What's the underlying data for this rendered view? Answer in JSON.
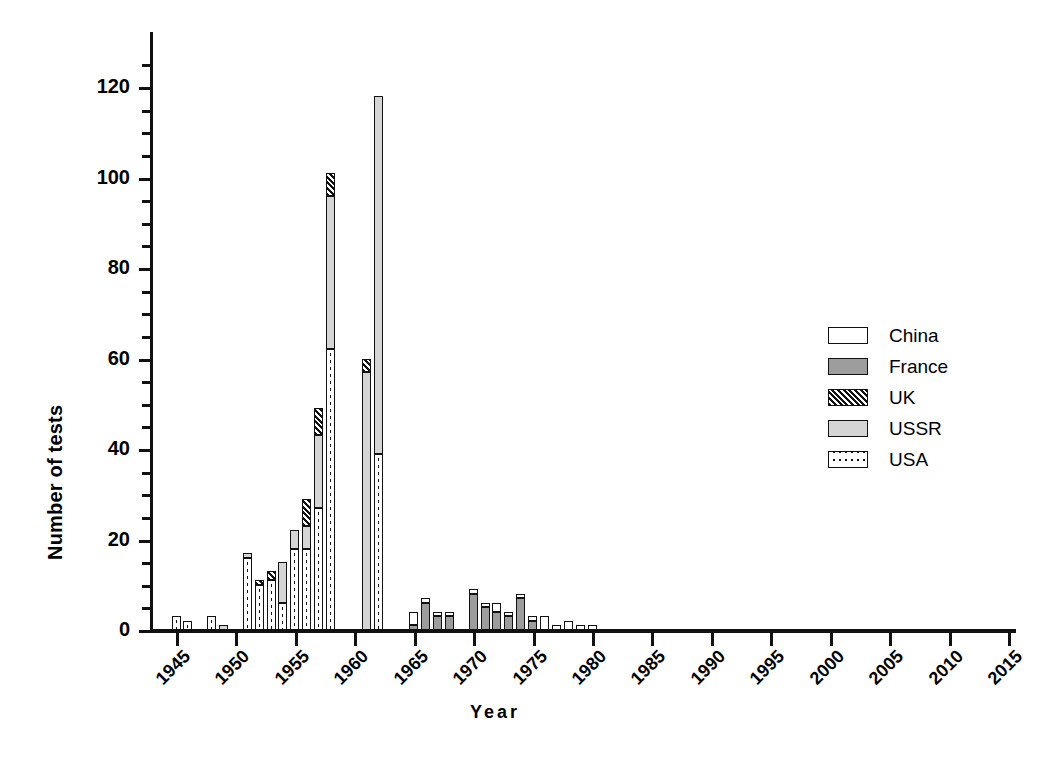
{
  "chart_data": {
    "type": "bar",
    "stacked": true,
    "title": "",
    "xlabel": "Year",
    "ylabel": "Number of tests",
    "xlim": [
      1943,
      2016
    ],
    "ylim": [
      0,
      128
    ],
    "ytick_major": [
      0,
      20,
      40,
      60,
      80,
      100,
      120
    ],
    "ytick_minor_step": 5,
    "xticks": [
      1945,
      1950,
      1955,
      1960,
      1965,
      1970,
      1975,
      1980,
      1985,
      1990,
      1995,
      2000,
      2005,
      2010,
      2015
    ],
    "grid": false,
    "legend_position": "right",
    "series_order": [
      "USA",
      "USSR",
      "UK",
      "France",
      "China"
    ],
    "legend": [
      {
        "name": "China",
        "pattern": "solid-white",
        "color": "#ffffff"
      },
      {
        "name": "France",
        "pattern": "solid-gray",
        "color": "#9d9d9d"
      },
      {
        "name": "UK",
        "pattern": "diagonal-hatch",
        "color": "#111111"
      },
      {
        "name": "USSR",
        "pattern": "light-gray",
        "color": "#d5d5d5"
      },
      {
        "name": "USA",
        "pattern": "dotted",
        "color": "#ffffff"
      }
    ],
    "categories": [
      1945,
      1946,
      1947,
      1948,
      1949,
      1950,
      1951,
      1952,
      1953,
      1954,
      1955,
      1956,
      1957,
      1958,
      1959,
      1960,
      1961,
      1962,
      1963,
      1964,
      1965,
      1966,
      1967,
      1968,
      1969,
      1970,
      1971,
      1972,
      1973,
      1974,
      1975,
      1976,
      1977,
      1978,
      1979,
      1980,
      1981,
      1982,
      1983,
      1984,
      1985,
      1986,
      1987,
      1988,
      1989,
      1990,
      1991,
      1992,
      1993,
      1994,
      1995,
      1996,
      1997,
      1998,
      1999,
      2000,
      2001,
      2002,
      2003,
      2004,
      2005,
      2006,
      2007,
      2008,
      2009,
      2010,
      2011,
      2012,
      2013,
      2014,
      2015
    ],
    "series": [
      {
        "name": "USA",
        "values": [
          3,
          2,
          0,
          3,
          0,
          0,
          16,
          10,
          11,
          6,
          18,
          18,
          27,
          62,
          0,
          0,
          0,
          39,
          0,
          0,
          0,
          0,
          0,
          0,
          0,
          0,
          0,
          0,
          0,
          0,
          0,
          0,
          0,
          0,
          0,
          0,
          0,
          0,
          0,
          0,
          0,
          0,
          0,
          0,
          0,
          0,
          0,
          0,
          0,
          0,
          0,
          0,
          0,
          0,
          0,
          0,
          0,
          0,
          0,
          0,
          0,
          0,
          0,
          0,
          0,
          0,
          0,
          0,
          0,
          0,
          0
        ]
      },
      {
        "name": "USSR",
        "values": [
          0,
          0,
          0,
          0,
          1,
          0,
          1,
          0,
          0,
          9,
          4,
          5,
          16,
          34,
          0,
          0,
          57,
          79,
          0,
          0,
          0,
          0,
          0,
          0,
          0,
          0,
          0,
          0,
          0,
          0,
          0,
          0,
          0,
          0,
          0,
          0,
          0,
          0,
          0,
          0,
          0,
          0,
          0,
          0,
          0,
          0,
          0,
          0,
          0,
          0,
          0,
          0,
          0,
          0,
          0,
          0,
          0,
          0,
          0,
          0,
          0,
          0,
          0,
          0,
          0,
          0,
          0,
          0,
          0,
          0,
          0
        ]
      },
      {
        "name": "UK",
        "values": [
          0,
          0,
          0,
          0,
          0,
          0,
          0,
          1,
          2,
          0,
          0,
          6,
          6,
          5,
          0,
          0,
          3,
          0,
          0,
          0,
          0,
          0,
          0,
          0,
          0,
          0,
          0,
          0,
          0,
          0,
          0,
          0,
          0,
          0,
          0,
          0,
          0,
          0,
          0,
          0,
          0,
          0,
          0,
          0,
          0,
          0,
          0,
          0,
          0,
          0,
          0,
          0,
          0,
          0,
          0,
          0,
          0,
          0,
          0,
          0,
          0,
          0,
          0,
          0,
          0,
          0,
          0,
          0,
          0,
          0,
          0
        ]
      },
      {
        "name": "France",
        "values": [
          0,
          0,
          0,
          0,
          0,
          0,
          0,
          0,
          0,
          0,
          0,
          0,
          0,
          0,
          0,
          0,
          0,
          0,
          0,
          0,
          1,
          6,
          3,
          3,
          0,
          8,
          5,
          4,
          3,
          7,
          2,
          0,
          0,
          0,
          0,
          0,
          0,
          0,
          0,
          0,
          0,
          0,
          0,
          0,
          0,
          0,
          0,
          0,
          0,
          0,
          0,
          0,
          0,
          0,
          0,
          0,
          0,
          0,
          0,
          0,
          0,
          0,
          0,
          0,
          0,
          0,
          0,
          0,
          0,
          0,
          0
        ]
      },
      {
        "name": "China",
        "values": [
          0,
          0,
          0,
          0,
          0,
          0,
          0,
          0,
          0,
          0,
          0,
          0,
          0,
          0,
          0,
          0,
          0,
          0,
          0,
          0,
          3,
          1,
          1,
          1,
          0,
          1,
          1,
          2,
          1,
          1,
          1,
          3,
          1,
          2,
          1,
          1,
          0,
          0,
          0,
          0,
          0,
          0,
          0,
          0,
          0,
          0,
          0,
          0,
          0,
          0,
          0,
          0,
          0,
          0,
          0,
          0,
          0,
          0,
          0,
          0,
          0,
          0,
          0,
          0,
          0,
          0,
          0,
          0,
          0,
          0,
          0
        ]
      }
    ],
    "totals": [
      3,
      2,
      0,
      3,
      1,
      0,
      17,
      11,
      13,
      15,
      22,
      29,
      49,
      101,
      0,
      0,
      60,
      118,
      0,
      0,
      4,
      7,
      4,
      4,
      0,
      9,
      6,
      6,
      4,
      8,
      3,
      3,
      1,
      2,
      1,
      1,
      0,
      0,
      0,
      0,
      0,
      0,
      0,
      0,
      0,
      0,
      0,
      0,
      0,
      0,
      0,
      0,
      0,
      0,
      0,
      0,
      0,
      0,
      0,
      0,
      0,
      0,
      0,
      0,
      0,
      0,
      0,
      0,
      0,
      0,
      0
    ]
  }
}
